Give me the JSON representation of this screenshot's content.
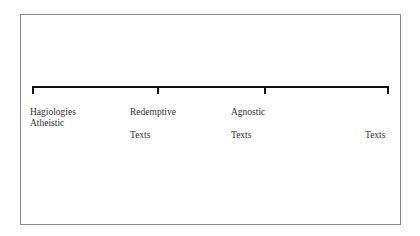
{
  "diagram": {
    "type": "spectrum-scale",
    "ticks": [
      {
        "position": 0,
        "labels": [
          "Hagiologies",
          "Atheistic"
        ]
      },
      {
        "position": 1,
        "labels": [
          "Redemptive",
          "Texts"
        ]
      },
      {
        "position": 2,
        "labels": [
          "Agnostic",
          "Texts"
        ]
      },
      {
        "position": 3,
        "labels": [
          "Texts"
        ]
      }
    ]
  }
}
